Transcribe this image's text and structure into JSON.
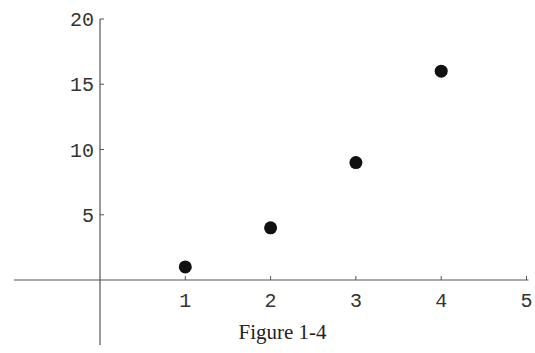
{
  "chart_data": {
    "type": "scatter",
    "title": "",
    "caption": "Figure 1-4",
    "xlabel": "",
    "ylabel": "",
    "x": [
      1,
      2,
      3,
      4
    ],
    "y": [
      1,
      4,
      9,
      16
    ],
    "series": [
      {
        "name": "points",
        "x": [
          1,
          2,
          3,
          4
        ],
        "y": [
          1,
          4,
          9,
          16
        ]
      }
    ],
    "xlim": [
      -1,
      5
    ],
    "ylim": [
      -5,
      20
    ],
    "x_ticks": [
      1,
      2,
      3,
      4,
      5
    ],
    "y_ticks": [
      5,
      10,
      15,
      20
    ],
    "grid": false,
    "legend": "none",
    "marker_color": "#111111",
    "axis_color": "#555555"
  },
  "figure": {
    "caption": "Figure 1-4"
  }
}
